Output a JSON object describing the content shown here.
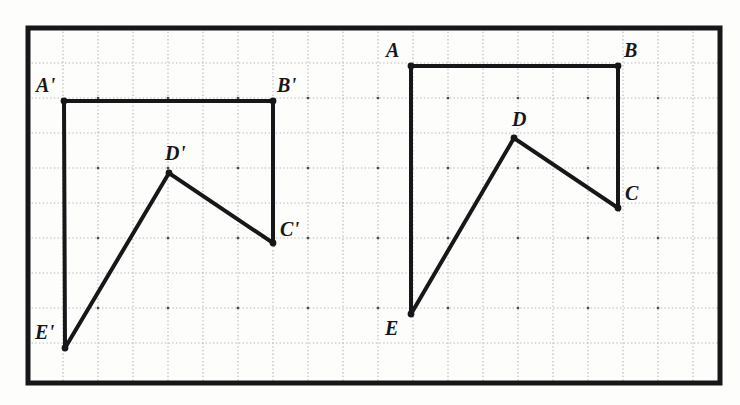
{
  "figure": {
    "background_color": "#fdfdfb",
    "ink_color": "#17171a",
    "grid_color": "#a8a8ad",
    "border": {
      "x": 28,
      "y": 28,
      "width": 692,
      "height": 355,
      "stroke_width": 5
    },
    "grid": {
      "spacing": 35,
      "x_lines": [
        63,
        98,
        133,
        168,
        203,
        238,
        273,
        308,
        343,
        378,
        413,
        448,
        483,
        518,
        553,
        588,
        623,
        658,
        693
      ],
      "y_lines": [
        63,
        98,
        133,
        168,
        203,
        238,
        273,
        308,
        343
      ],
      "style": "dotted"
    },
    "shapes": [
      {
        "name": "image-pentagon",
        "id": "pentagon-prime",
        "closed": false,
        "stroke_width": 4,
        "vertices": [
          {
            "label": "A'",
            "x": 64,
            "y": 101,
            "dot": true,
            "label_dx": -28,
            "label_dy": -26
          },
          {
            "label": "B'",
            "x": 273,
            "y": 101,
            "dot": true,
            "label_dx": 4,
            "label_dy": -26
          },
          {
            "label": "C'",
            "x": 273,
            "y": 243,
            "dot": true,
            "label_dx": 7,
            "label_dy": -24
          },
          {
            "label": "D'",
            "x": 169,
            "y": 173,
            "dot": true,
            "label_dx": -4,
            "label_dy": -30
          },
          {
            "label": "E'",
            "x": 65,
            "y": 348,
            "dot": true,
            "label_dx": -30,
            "label_dy": -26
          }
        ],
        "path_order": [
          "E'",
          "A'",
          "B'",
          "C'",
          "D'",
          "E'"
        ]
      },
      {
        "name": "preimage-pentagon",
        "id": "pentagon-plain",
        "closed": false,
        "stroke_width": 4,
        "vertices": [
          {
            "label": "A",
            "x": 411,
            "y": 66,
            "dot": true,
            "label_dx": -25,
            "label_dy": -26
          },
          {
            "label": "B",
            "x": 618,
            "y": 66,
            "dot": true,
            "label_dx": 6,
            "label_dy": -26
          },
          {
            "label": "C",
            "x": 618,
            "y": 208,
            "dot": true,
            "label_dx": 7,
            "label_dy": -25
          },
          {
            "label": "D",
            "x": 514,
            "y": 138,
            "dot": true,
            "label_dx": -2,
            "label_dy": -29
          },
          {
            "label": "E",
            "x": 411,
            "y": 314,
            "dot": true,
            "label_dx": -26,
            "label_dy": 4
          }
        ],
        "path_order": [
          "E",
          "A",
          "B",
          "C",
          "D",
          "E"
        ]
      }
    ]
  }
}
